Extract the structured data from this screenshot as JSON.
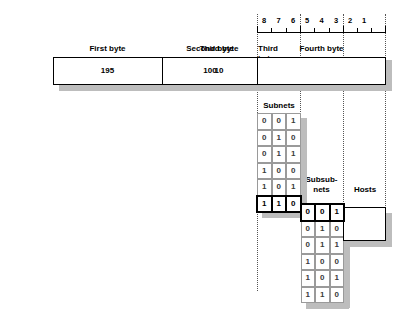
{
  "bit_ruler": {
    "bits": [
      "8",
      "7",
      "6",
      "5",
      "4",
      "3",
      "2",
      "1"
    ]
  },
  "byte_bar": {
    "headers": [
      "First byte",
      "Second byte",
      "Third byte",
      "Fourth byte"
    ],
    "values": [
      "195",
      "100",
      "10",
      ""
    ]
  },
  "subnets": {
    "caption": "Subnets",
    "rows": [
      [
        "0",
        "0",
        "1"
      ],
      [
        "0",
        "1",
        "0"
      ],
      [
        "0",
        "1",
        "1"
      ],
      [
        "1",
        "0",
        "0"
      ],
      [
        "1",
        "0",
        "1"
      ],
      [
        "1",
        "1",
        "0"
      ]
    ],
    "highlighted_row_index": 5
  },
  "subsubnets": {
    "caption_line1": "Subsub-",
    "caption_line2": "nets",
    "rows": [
      [
        "0",
        "0",
        "1"
      ],
      [
        "0",
        "1",
        "0"
      ],
      [
        "0",
        "1",
        "1"
      ],
      [
        "1",
        "0",
        "0"
      ],
      [
        "1",
        "0",
        "1"
      ],
      [
        "1",
        "1",
        "0"
      ]
    ],
    "highlighted_row_index": 0
  },
  "hosts": {
    "caption": "Hosts",
    "value": ""
  },
  "colors": {
    "line": "#000000",
    "grid": "#9a9a9a",
    "shadow": "#bdbdbd",
    "dotted_guide": "#555555",
    "cell_text": "#3a3a3a",
    "background": "#ffffff"
  }
}
